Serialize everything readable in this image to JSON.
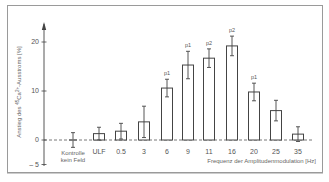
{
  "chart_data": {
    "type": "bar",
    "title": "",
    "xlabel": "Frequenz der Amplitudenmodulation [Hz]",
    "ylabel": "Anstieg des 45Ca2+-Ausstroms [%]",
    "ylim": [
      -5,
      24
    ],
    "yticks": [
      -5,
      0,
      10,
      20
    ],
    "grid": false,
    "legend": null,
    "categories": [
      "Kontrolle kein Feld",
      "ULF",
      "0.5",
      "3",
      "6",
      "9",
      "11",
      "16",
      "20",
      "25",
      "35"
    ],
    "values": [
      0,
      1.3,
      1.8,
      3.7,
      10.6,
      15.3,
      16.7,
      19.2,
      9.8,
      6.0,
      1.2
    ],
    "errors": [
      1.5,
      1.3,
      1.6,
      3.2,
      1.8,
      2.8,
      1.9,
      2.0,
      1.8,
      2.1,
      1.5
    ],
    "annotations": [
      "",
      "",
      "",
      "",
      "p1",
      "p1",
      "p2",
      "p2",
      "p1",
      "",
      ""
    ]
  },
  "labels": {
    "control_line1": "Kontrolle",
    "control_line2": "kein Feld",
    "xlabel": "Frequenz der Amplitudenmodulation [Hz]",
    "ylabel_prefix": "Anstieg des ",
    "ylabel_sup": "45",
    "ylabel_ca": "Ca",
    "ylabel_sup2": "2+",
    "ylabel_suffix": "-Ausstroms [%]"
  }
}
